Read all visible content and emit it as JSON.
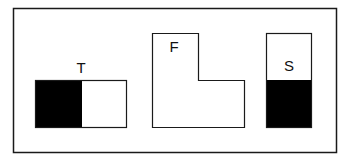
{
  "diagram": {
    "type": "orthographic-views",
    "views": [
      {
        "id": "top",
        "label": "T"
      },
      {
        "id": "front",
        "label": "F"
      },
      {
        "id": "side",
        "label": "S"
      }
    ]
  },
  "colors": {
    "stroke": "#1a1a1a",
    "fill_dark": "#000000",
    "fill_light": "#ffffff"
  }
}
